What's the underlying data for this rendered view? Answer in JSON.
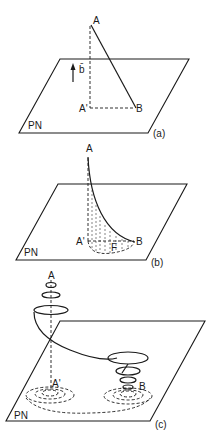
{
  "figure": {
    "panels": [
      {
        "id": "a",
        "caption": "(a)",
        "plane_label": "PN",
        "points": {
          "A": "A",
          "A_prime": "A'",
          "B": "B"
        },
        "vector_label": "b̄",
        "description": "Straight line from A to B with perpendicular projection A-A' and dashed A'-B on plane"
      },
      {
        "id": "b",
        "caption": "(b)",
        "plane_label": "PN",
        "points": {
          "A": "A",
          "A_prime": "A'",
          "B": "B",
          "F": "F"
        },
        "description": "Curved path from A down to B with hatched projection area F"
      },
      {
        "id": "c",
        "caption": "(c)",
        "plane_label": "PN",
        "points": {
          "A": "A",
          "A_prime": "A'",
          "B": "B"
        },
        "description": "Helical spiral path from A to B with concentric dashed ellipses on plane"
      }
    ]
  }
}
